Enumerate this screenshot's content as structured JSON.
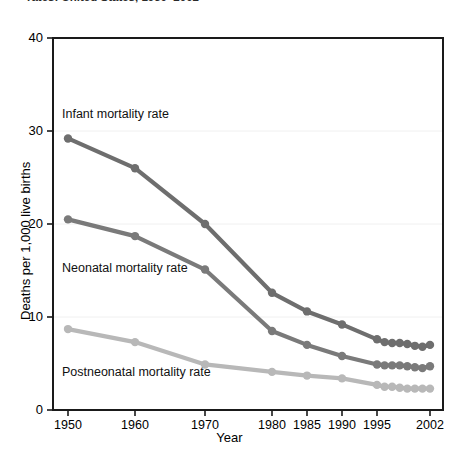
{
  "figure": {
    "title_clipped": "rates: United States, 1950–2002",
    "xlabel": "Year",
    "ylabel": "Deaths per 1,000 live births"
  },
  "labels": {
    "infant": "Infant mortality rate",
    "neonatal": "Neonatal mortality rate",
    "postneonatal": "Postneonatal mortality rate"
  },
  "chart_data": {
    "type": "line",
    "title": "rates: United States, 1950–2002",
    "xlabel": "Year",
    "ylabel": "Deaths per 1,000 live births",
    "ylim": [
      0,
      40
    ],
    "yticks": [
      0,
      10,
      20,
      30,
      40
    ],
    "ytick_labels": [
      "0",
      "10",
      "20",
      "30",
      "40"
    ],
    "xticks": [
      1950,
      1960,
      1970,
      1980,
      1985,
      1990,
      1995,
      2002
    ],
    "xtick_labels": [
      "1950",
      "1960",
      "1970",
      "1980",
      "1985",
      "1990",
      "1995",
      "2002"
    ],
    "x_axis_scale": "non-linear (decades 1950-1980, 5-year 1980-1995, annual 1995-2002)",
    "grid": false,
    "legend": "inline series labels, no legend box",
    "x": [
      1950,
      1960,
      1970,
      1980,
      1985,
      1990,
      1995,
      1996,
      1997,
      1998,
      1999,
      2000,
      2001,
      2002
    ],
    "series": [
      {
        "name": "Infant mortality rate",
        "color": "#6e6e6e",
        "values": [
          29.2,
          26.0,
          20.0,
          12.6,
          10.6,
          9.2,
          7.6,
          7.3,
          7.2,
          7.2,
          7.1,
          6.9,
          6.8,
          7.0
        ]
      },
      {
        "name": "Neonatal mortality rate",
        "color": "#7a7a7a",
        "values": [
          20.5,
          18.7,
          15.1,
          8.5,
          7.0,
          5.8,
          4.9,
          4.8,
          4.8,
          4.8,
          4.7,
          4.6,
          4.5,
          4.7
        ]
      },
      {
        "name": "Postneonatal mortality rate",
        "color": "#b8b8b8",
        "values": [
          8.7,
          7.3,
          4.9,
          4.1,
          3.7,
          3.4,
          2.7,
          2.5,
          2.5,
          2.4,
          2.3,
          2.3,
          2.3,
          2.3
        ]
      }
    ]
  },
  "yticks": [
    {
      "label": "40",
      "value": 40
    },
    {
      "label": "30",
      "value": 30
    },
    {
      "label": "20",
      "value": 20
    },
    {
      "label": "10",
      "value": 10
    },
    {
      "label": "0",
      "value": 0
    }
  ],
  "xticks": [
    {
      "label": "1950",
      "value": 1950
    },
    {
      "label": "1960",
      "value": 1960
    },
    {
      "label": "1970",
      "value": 1970
    },
    {
      "label": "1980",
      "value": 1980
    },
    {
      "label": "1985",
      "value": 1985
    },
    {
      "label": "1990",
      "value": 1990
    },
    {
      "label": "1995",
      "value": 1995
    },
    {
      "label": "2002",
      "value": 2002
    }
  ]
}
